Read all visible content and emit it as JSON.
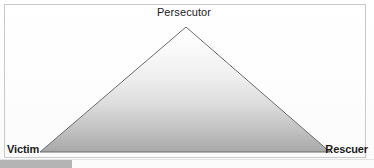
{
  "figure": {
    "name": "drama-triangle",
    "frame": {
      "border_color": "#c9c9c9",
      "background_color": "#ffffff"
    }
  },
  "diagram": {
    "type": "triangle",
    "shape": "isosceles-triangle",
    "outline_color": "#6b6b6b",
    "fill_gradient_top": "#ffffff",
    "fill_gradient_bottom": "#a8a8a8",
    "vertices": [
      {
        "id": "apex",
        "label": "Persecutor",
        "position": "top",
        "x": 186,
        "y": 27,
        "bold": false
      },
      {
        "id": "bottom-left",
        "label": "Victim",
        "position": "bottom-left",
        "x": 40,
        "y": 152,
        "bold": true
      },
      {
        "id": "bottom-right",
        "label": "Rescuer",
        "position": "bottom-right",
        "x": 330,
        "y": 152,
        "bold": true
      }
    ]
  },
  "labels": {
    "apex": "Persecutor",
    "bottom_left": "Victim",
    "bottom_right": "Rescuer"
  },
  "artifacts": {
    "bottom_left_band_color": "#b4b4b4"
  }
}
